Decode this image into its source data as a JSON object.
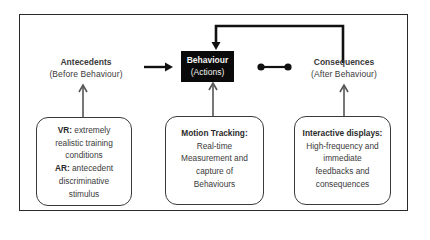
{
  "diagram": {
    "colors": {
      "frame": "#2a2a2a",
      "behaviour_fill": "#0a0a0a",
      "behaviour_text": "#f2f2f2",
      "arrow_dark": "#111111",
      "arrow_grey": "#555555",
      "text": "#3a3a3a"
    },
    "antecedents": {
      "title": "Antecedents",
      "subtitle": "(Before Behaviour)"
    },
    "behaviour": {
      "title": "Behaviour",
      "subtitle": "(Actions)"
    },
    "consequences": {
      "title": "Consequences",
      "subtitle": "(After Behaviour)"
    },
    "boxes": {
      "vr_ar": {
        "vr_label": "VR:",
        "vr_text_1": "extremely",
        "vr_text_2": "realistic  training",
        "vr_text_3": "conditions",
        "ar_label": "AR:",
        "ar_text_1": "antecedent",
        "ar_text_2": "discriminative",
        "ar_text_3": "stimulus"
      },
      "motion_tracking": {
        "label": "Motion Tracking:",
        "line_1": "Real-time",
        "line_2": "Measurement and",
        "line_3": "capture of",
        "line_4": "Behaviours"
      },
      "interactive_displays": {
        "label": "Interactive displays:",
        "line_1": "High-frequency and",
        "line_2": "immediate",
        "line_3": "feedbacks and",
        "line_4": "consequences"
      }
    },
    "connectors": [
      {
        "from": "antecedents",
        "to": "behaviour",
        "type": "arrow"
      },
      {
        "from": "behaviour",
        "to": "consequences",
        "type": "dumbbell"
      },
      {
        "from": "consequences",
        "to": "behaviour",
        "type": "feedback-arrow"
      },
      {
        "from": "vr_ar",
        "to": "antecedents",
        "type": "arrow"
      },
      {
        "from": "motion_tracking",
        "to": "behaviour",
        "type": "arrow"
      },
      {
        "from": "interactive_displays",
        "to": "consequences",
        "type": "arrow"
      }
    ]
  }
}
